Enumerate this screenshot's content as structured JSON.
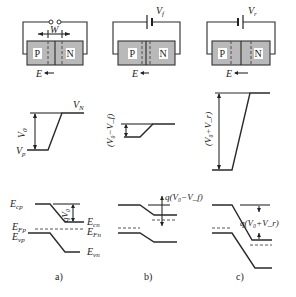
{
  "figure": {
    "panels": [
      {
        "id": "a",
        "caption": "a)",
        "circuit": {
          "p_label": "P",
          "n_label": "N",
          "width_label": "W",
          "field_label": "E",
          "source": "open-terminals"
        },
        "potential": {
          "high_label": "V",
          "high_sub": "N",
          "low_label": "V",
          "low_sub": "p",
          "diff_label": "V",
          "diff_sub": "0"
        },
        "bands": {
          "ecp": {
            "main": "E",
            "sub": "cp"
          },
          "ecn": {
            "main": "E",
            "sub": "cn"
          },
          "efp": {
            "main": "E",
            "sub": "Fp"
          },
          "efn": {
            "main": "E",
            "sub": "Fn"
          },
          "evp": {
            "main": "E",
            "sub": "vp"
          },
          "evn": {
            "main": "E",
            "sub": "vn"
          },
          "barrier": "qV₀"
        }
      },
      {
        "id": "b",
        "caption": "b)",
        "circuit": {
          "p_label": "P",
          "n_label": "N",
          "field_label": "E",
          "source_label": "V",
          "source_sub": "f"
        },
        "potential": {
          "diff_label": "(V₀−V_f)"
        },
        "bands": {
          "barrier": "q(V₀−V_f)"
        }
      },
      {
        "id": "c",
        "caption": "c)",
        "circuit": {
          "p_label": "P",
          "n_label": "N",
          "field_label": "E",
          "source_label": "V",
          "source_sub": "r"
        },
        "potential": {
          "diff_label": "(V₀+V_r)"
        },
        "bands": {
          "barrier": "q(V₀+V_r)"
        }
      }
    ]
  }
}
